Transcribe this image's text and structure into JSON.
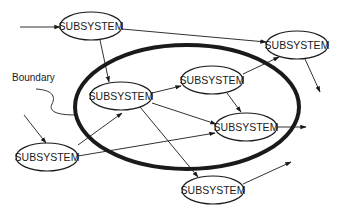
{
  "diagram": {
    "boundary": {
      "label": "Boundary",
      "cx": 187,
      "cy": 107,
      "rx": 112,
      "ry": 62,
      "stroke_width": 4
    },
    "colors": {
      "stroke": "#1a1a1a",
      "background": "#ffffff"
    },
    "nodes": [
      {
        "id": "A",
        "label": "SUBSYSTEM",
        "cx": 91,
        "cy": 26,
        "rx": 31,
        "ry": 14
      },
      {
        "id": "B",
        "label": "SUBSYSTEM",
        "cx": 297,
        "cy": 45,
        "rx": 31,
        "ry": 14
      },
      {
        "id": "C",
        "label": "SUBSYSTEM",
        "cx": 121,
        "cy": 96,
        "rx": 31,
        "ry": 14
      },
      {
        "id": "D",
        "label": "SUBSYSTEM",
        "cx": 212,
        "cy": 80,
        "rx": 31,
        "ry": 14
      },
      {
        "id": "E",
        "label": "SUBSYSTEM",
        "cx": 246,
        "cy": 127,
        "rx": 31,
        "ry": 14
      },
      {
        "id": "F",
        "label": "SUBSYSTEM",
        "cx": 47,
        "cy": 157,
        "rx": 31,
        "ry": 14
      },
      {
        "id": "G",
        "label": "SUBSYSTEM",
        "cx": 213,
        "cy": 190,
        "rx": 31,
        "ry": 14
      }
    ],
    "edges": [
      {
        "from": "external",
        "to": "A",
        "x1": 20,
        "y1": 27,
        "x2": 60,
        "y2": 27
      },
      {
        "from": "A",
        "to": "B",
        "x1": 122,
        "y1": 29,
        "x2": 266,
        "y2": 42
      },
      {
        "from": "A",
        "to": "C",
        "x1": 100,
        "y1": 40,
        "x2": 109,
        "y2": 82
      },
      {
        "from": "C",
        "to": "D",
        "x1": 152,
        "y1": 93,
        "x2": 181,
        "y2": 86
      },
      {
        "from": "C",
        "to": "E",
        "x1": 152,
        "y1": 103,
        "x2": 216,
        "y2": 124
      },
      {
        "from": "C",
        "to": "G",
        "x1": 140,
        "y1": 107,
        "x2": 198,
        "y2": 177
      },
      {
        "from": "D",
        "to": "B",
        "x1": 243,
        "y1": 74,
        "x2": 279,
        "y2": 57
      },
      {
        "from": "D",
        "to": "E",
        "x1": 227,
        "y1": 93,
        "x2": 241,
        "y2": 112
      },
      {
        "from": "B",
        "to": "external",
        "x1": 305,
        "y1": 59,
        "x2": 320,
        "y2": 92
      },
      {
        "from": "E",
        "to": "external",
        "x1": 277,
        "y1": 127,
        "x2": 306,
        "y2": 127
      },
      {
        "from": "external",
        "to": "F",
        "x1": 24,
        "y1": 115,
        "x2": 46,
        "y2": 143
      },
      {
        "from": "F",
        "to": "C",
        "x1": 78,
        "y1": 145,
        "x2": 122,
        "y2": 113
      },
      {
        "from": "F",
        "to": "E",
        "x1": 78,
        "y1": 156,
        "x2": 215,
        "y2": 133
      },
      {
        "from": "G",
        "to": "external",
        "x1": 243,
        "y1": 184,
        "x2": 291,
        "y2": 162
      }
    ],
    "boundary_pointer": {
      "label_x": 12,
      "label_y": 81,
      "path": "M 36 89 C 52 90, 56 96, 52 104 C 48 112, 58 115, 76 115"
    }
  }
}
